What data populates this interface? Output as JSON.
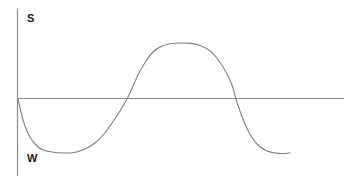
{
  "figure": {
    "y_axis_top_label": "S",
    "y_axis_bottom_label": "W",
    "axis_color": "#8c8c8c",
    "curve_color": "#7d7d7d",
    "label_color": "#1a1a1a",
    "background_color": "#ffffff"
  },
  "chart_data": {
    "type": "line",
    "title": "",
    "xlabel": "",
    "ylabel_top": "S",
    "ylabel_bottom": "W",
    "legend": "none",
    "grid": false,
    "axes": {
      "y_axis_x_px": 17.5,
      "y_axis_y1_px": 9,
      "y_axis_y2_px": 176,
      "x_axis_y_px": 98.5,
      "x_axis_x1_px": 17.5,
      "x_axis_x2_px": 344
    },
    "axis_crossings_x_px": [
      18,
      127,
      236
    ],
    "trough_y_px": 152.5,
    "peak_y_px": 43,
    "curve_points_px": [
      [
        18,
        99
      ],
      [
        21,
        112
      ],
      [
        25,
        126
      ],
      [
        30,
        137
      ],
      [
        36,
        145
      ],
      [
        43,
        150
      ],
      [
        52,
        152
      ],
      [
        63,
        153
      ],
      [
        74,
        152.5
      ],
      [
        85,
        149
      ],
      [
        95,
        143
      ],
      [
        104,
        134
      ],
      [
        112,
        123
      ],
      [
        120,
        111
      ],
      [
        127,
        99
      ],
      [
        133,
        86
      ],
      [
        139,
        73
      ],
      [
        146,
        61
      ],
      [
        153,
        52
      ],
      [
        161,
        46.5
      ],
      [
        170,
        43.8
      ],
      [
        181,
        43
      ],
      [
        191,
        43.4
      ],
      [
        200,
        45.5
      ],
      [
        209,
        50
      ],
      [
        216,
        57
      ],
      [
        223,
        67
      ],
      [
        229,
        78
      ],
      [
        233,
        88
      ],
      [
        236,
        99
      ],
      [
        240,
        111
      ],
      [
        245,
        124
      ],
      [
        251,
        136
      ],
      [
        258,
        145
      ],
      [
        266,
        150.5
      ],
      [
        275,
        153
      ],
      [
        283,
        153.5
      ],
      [
        290,
        152.8
      ]
    ]
  }
}
